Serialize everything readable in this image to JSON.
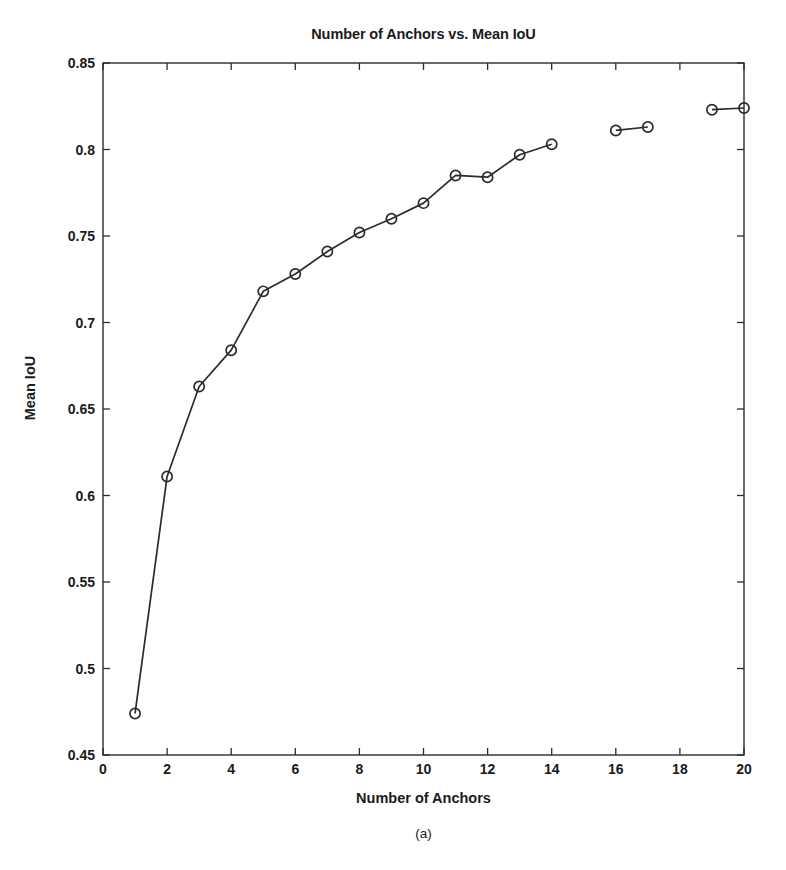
{
  "chart_data": {
    "type": "line",
    "title": "Number of Anchors vs. Mean IoU",
    "xlabel": "Number of Anchors",
    "ylabel": "Mean IoU",
    "subcaption": "(a)",
    "x": [
      1,
      2,
      3,
      4,
      5,
      6,
      7,
      8,
      9,
      10,
      11,
      12,
      13,
      14,
      16,
      17,
      19,
      20
    ],
    "values": [
      0.474,
      0.611,
      0.663,
      0.684,
      0.718,
      0.728,
      0.741,
      0.752,
      0.76,
      0.769,
      0.785,
      0.784,
      0.797,
      0.803,
      0.811,
      0.813,
      0.823,
      0.824
    ],
    "segments": [
      {
        "x": [
          1,
          2,
          3,
          4,
          5,
          6,
          7,
          8,
          9,
          10,
          11,
          12,
          13,
          14
        ],
        "values": [
          0.474,
          0.611,
          0.663,
          0.684,
          0.718,
          0.728,
          0.741,
          0.752,
          0.76,
          0.769,
          0.785,
          0.784,
          0.797,
          0.803
        ]
      },
      {
        "x": [
          16,
          17
        ],
        "values": [
          0.811,
          0.813
        ]
      },
      {
        "x": [
          19,
          20
        ],
        "values": [
          0.823,
          0.824
        ]
      }
    ],
    "xlim": [
      0,
      20
    ],
    "ylim": [
      0.45,
      0.85
    ],
    "xticks": [
      0,
      2,
      4,
      6,
      8,
      10,
      12,
      14,
      16,
      18,
      20
    ],
    "xtick_labels": [
      "0",
      "2",
      "4",
      "6",
      "8",
      "10",
      "12",
      "14",
      "16",
      "18",
      "20"
    ],
    "yticks": [
      0.45,
      0.5,
      0.55,
      0.6,
      0.65,
      0.7,
      0.75,
      0.8,
      0.85
    ],
    "ytick_labels": [
      "0.45",
      "0.5",
      "0.55",
      "0.6",
      "0.65",
      "0.7",
      "0.75",
      "0.8",
      "0.85"
    ],
    "grid": false,
    "legend": null,
    "marker": "circle-open",
    "line_color": "#2b2b2b",
    "marker_color": "#2b2b2b",
    "background_color": "#ffffff",
    "axis_color": "#2b2b2b"
  }
}
